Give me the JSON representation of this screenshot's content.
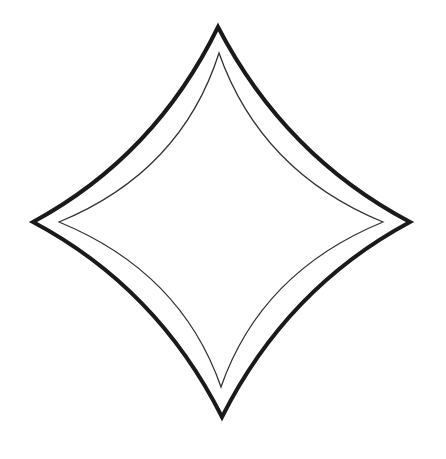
{
  "figure": {
    "background": "#ffffff",
    "outer_outline": {
      "color": "#1a1a1a",
      "stroke_width": 4,
      "points": {
        "top": [
          218,
          27
        ],
        "right": [
          410,
          222
        ],
        "bottom": [
          222,
          417
        ],
        "left": [
          33,
          222
        ]
      },
      "path": "M218,27 Q285,156 410,222 Q287,288 222,417 Q157,288 33,222 Q155,156 218,27 Z"
    },
    "inner_outline": {
      "color": "#333333",
      "stroke_width": 1.3,
      "points": {
        "top": [
          219,
          53
        ],
        "right": [
          383,
          222
        ],
        "bottom": [
          221,
          387
        ],
        "left": [
          59,
          222
        ]
      },
      "path": "M219,53 Q261,172 383,222 Q261,272 221,387 Q181,272 59,222 Q181,172 219,53 Z"
    }
  }
}
